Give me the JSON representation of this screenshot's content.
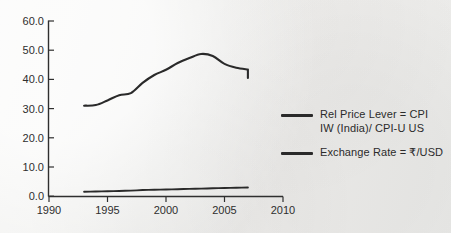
{
  "figure": {
    "background_color": "#f1f1ef",
    "ink_color": "#2a2a2a"
  },
  "axes": {
    "y_tick_labels": [
      "60.0",
      "50.0",
      "40.0",
      "30.0",
      "20.0",
      "10.0",
      "0.0"
    ],
    "x_tick_labels": [
      "1990",
      "1995",
      "2000",
      "2005",
      "2010"
    ]
  },
  "legend": {
    "entries": [
      {
        "label": "Rel Price Lever = CPI\nIW (India)/ CPI-U US",
        "color": "#2a2a2a",
        "swatch_name": "legend-line-swatch"
      },
      {
        "label": "Exchange Rate = ₹/USD",
        "color": "#2a2a2a",
        "swatch_name": "legend-line-swatch"
      }
    ]
  },
  "chart_data": {
    "type": "line",
    "title": "",
    "xlabel": "",
    "ylabel": "",
    "xlim": [
      1990,
      2010
    ],
    "ylim": [
      0.0,
      60.0
    ],
    "xticks": [
      1990,
      1995,
      2000,
      2005,
      2010
    ],
    "yticks": [
      0.0,
      10.0,
      20.0,
      30.0,
      40.0,
      50.0,
      60.0
    ],
    "grid": false,
    "legend_position": "right",
    "x": [
      1993,
      1994,
      1995,
      1996,
      1997,
      1998,
      1999,
      2000,
      2001,
      2002,
      2003,
      2004,
      2005,
      2006,
      2007
    ],
    "series": [
      {
        "name": "Rel Price Lever = CPI IW (India)/ CPI-U US",
        "color": "#2a2a2a",
        "values": [
          31.0,
          31.2,
          32.8,
          34.6,
          35.3,
          38.8,
          41.5,
          43.3,
          45.6,
          47.3,
          48.7,
          48.0,
          45.3,
          44.0,
          43.4
        ]
      },
      {
        "name": "Exchange Rate = ₹/USD",
        "color": "#2a2a2a",
        "values": [
          1.5,
          1.6,
          1.7,
          1.8,
          1.9,
          2.1,
          2.2,
          2.3,
          2.4,
          2.5,
          2.6,
          2.7,
          2.8,
          2.9,
          3.0
        ]
      }
    ],
    "annotations": [
      {
        "text": "series 1 declines sharply at the final point to 40.5",
        "x": 2007,
        "y": 40.5
      }
    ]
  }
}
